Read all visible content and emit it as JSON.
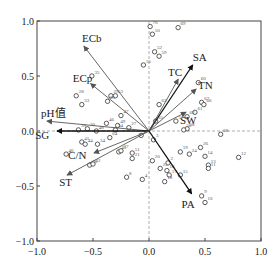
{
  "chart_data": {
    "type": "scatter",
    "subtype": "RDA biplot",
    "title": "",
    "xlabel": "",
    "ylabel": "",
    "xlim": [
      -1.0,
      1.0
    ],
    "ylim": [
      -1.0,
      1.0
    ],
    "xticks": [
      "-1.0",
      "-0.5",
      "0.0",
      "0.5",
      "1.0"
    ],
    "yticks": [
      "1.0",
      "0.5",
      "0.0",
      "-0.5",
      "-1.0"
    ],
    "grid": false,
    "zero_lines": true,
    "vectors": [
      {
        "name": "ECb",
        "x": -0.58,
        "y": 0.77,
        "color": "#555555",
        "label_dx": -2,
        "label_dy": -4
      },
      {
        "name": "ECp",
        "x": -0.52,
        "y": 0.43,
        "color": "#555555",
        "label_dx": -18,
        "label_dy": -2
      },
      {
        "name": "pH值",
        "x": -0.91,
        "y": 0.09,
        "color": "#555555",
        "label_dx": -6,
        "label_dy": -4
      },
      {
        "name": "SG",
        "x": -0.82,
        "y": 0.0,
        "color": "#111111",
        "label_dx": -22,
        "label_dy": 8
      },
      {
        "name": "C/N",
        "x": -0.49,
        "y": -0.2,
        "color": "#555555",
        "label_dx": -26,
        "label_dy": 6
      },
      {
        "name": "ST",
        "x": -0.73,
        "y": -0.4,
        "color": "#555555",
        "label_dx": -8,
        "label_dy": 11
      },
      {
        "name": "SA",
        "x": 0.39,
        "y": 0.6,
        "color": "#111111",
        "label_dx": 0,
        "label_dy": -4
      },
      {
        "name": "TC",
        "x": 0.26,
        "y": 0.47,
        "color": "#555555",
        "label_dx": -10,
        "label_dy": -3
      },
      {
        "name": "TN",
        "x": 0.42,
        "y": 0.38,
        "color": "#555555",
        "label_dx": 2,
        "label_dy": 0
      },
      {
        "name": "SW",
        "x": 0.33,
        "y": 0.17,
        "color": "#555555",
        "label_dx": -6,
        "label_dy": 12
      },
      {
        "name": "PA",
        "x": 0.38,
        "y": -0.57,
        "color": "#111111",
        "label_dx": -10,
        "label_dy": 14
      }
    ],
    "points": [
      {
        "id": "70",
        "x": 0.01,
        "y": 0.95
      },
      {
        "id": "69",
        "x": 0.26,
        "y": 0.94
      },
      {
        "id": "50",
        "x": 0.03,
        "y": 0.88
      },
      {
        "id": "52",
        "x": 0.05,
        "y": 0.72
      },
      {
        "id": "59",
        "x": 0.09,
        "y": 0.68
      },
      {
        "id": "55",
        "x": -0.05,
        "y": 0.6
      },
      {
        "id": "60",
        "x": 0.44,
        "y": 0.44
      },
      {
        "id": "63",
        "x": 0.09,
        "y": 0.24
      },
      {
        "id": "67",
        "x": 0.47,
        "y": 0.26
      },
      {
        "id": "66",
        "x": 0.49,
        "y": 0.24
      },
      {
        "id": "61",
        "x": 0.41,
        "y": 0.17
      },
      {
        "id": "62",
        "x": 0.34,
        "y": 0.13
      },
      {
        "id": "57",
        "x": 0.24,
        "y": 0.09
      },
      {
        "id": "65",
        "x": 0.06,
        "y": 0.09
      },
      {
        "id": "58",
        "x": 0.34,
        "y": 0.02
      },
      {
        "id": "56",
        "x": 0.31,
        "y": 0.01
      },
      {
        "id": "68",
        "x": 0.64,
        "y": -0.03
      },
      {
        "id": "12",
        "x": 0.8,
        "y": -0.24
      },
      {
        "id": "35",
        "x": -0.51,
        "y": 0.5
      },
      {
        "id": "28",
        "x": -0.65,
        "y": 0.32
      },
      {
        "id": "33",
        "x": -0.6,
        "y": 0.24
      },
      {
        "id": "29",
        "x": -0.34,
        "y": 0.32
      },
      {
        "id": "53",
        "x": -0.3,
        "y": 0.32
      },
      {
        "id": "25",
        "x": -0.37,
        "y": 0.27
      },
      {
        "id": "47",
        "x": -0.25,
        "y": 0.14
      },
      {
        "id": "46",
        "x": -0.38,
        "y": 0.07
      },
      {
        "id": "49",
        "x": -0.28,
        "y": 0.05
      },
      {
        "id": "27",
        "x": -0.18,
        "y": 0.03
      },
      {
        "id": "39",
        "x": -0.63,
        "y": 0.01
      },
      {
        "id": "30",
        "x": -0.55,
        "y": 0.02
      },
      {
        "id": "48",
        "x": -0.47,
        "y": 0.0
      },
      {
        "id": "54",
        "x": -0.3,
        "y": 0.01
      },
      {
        "id": "41",
        "x": -0.6,
        "y": -0.1
      },
      {
        "id": "44",
        "x": -0.57,
        "y": -0.12
      },
      {
        "id": "34",
        "x": -0.46,
        "y": -0.12
      },
      {
        "id": "64",
        "x": -0.35,
        "y": -0.06
      },
      {
        "id": "40",
        "x": -0.74,
        "y": -0.21
      },
      {
        "id": "45",
        "x": -0.27,
        "y": -0.19
      },
      {
        "id": "37",
        "x": -0.25,
        "y": -0.18
      },
      {
        "id": "38",
        "x": -0.53,
        "y": -0.31
      },
      {
        "id": "32",
        "x": -0.5,
        "y": -0.3
      },
      {
        "id": "1",
        "x": -0.07,
        "y": -0.04
      },
      {
        "id": "3",
        "x": 0.04,
        "y": -0.08
      },
      {
        "id": "51",
        "x": -0.15,
        "y": -0.2
      },
      {
        "id": "21",
        "x": -0.15,
        "y": -0.25
      },
      {
        "id": "8",
        "x": -0.2,
        "y": -0.42
      },
      {
        "id": "4",
        "x": -0.06,
        "y": -0.44
      },
      {
        "id": "19",
        "x": 0.28,
        "y": -0.19
      },
      {
        "id": "24",
        "x": 0.36,
        "y": -0.21
      },
      {
        "id": "26",
        "x": 0.46,
        "y": -0.15
      },
      {
        "id": "14",
        "x": 0.5,
        "y": -0.23
      },
      {
        "id": "13",
        "x": 0.53,
        "y": -0.31
      },
      {
        "id": "11",
        "x": 0.53,
        "y": -0.34
      },
      {
        "id": "20",
        "x": 0.03,
        "y": -0.27
      },
      {
        "id": "22",
        "x": 0.1,
        "y": -0.34
      },
      {
        "id": "2",
        "x": 0.17,
        "y": -0.29
      },
      {
        "id": "16",
        "x": 0.16,
        "y": -0.36
      },
      {
        "id": "17",
        "x": 0.18,
        "y": -0.4
      },
      {
        "id": "15",
        "x": 0.28,
        "y": -0.4
      },
      {
        "id": "18",
        "x": 0.14,
        "y": -0.46
      },
      {
        "id": "9",
        "x": 0.47,
        "y": -0.59
      },
      {
        "id": "10",
        "x": 0.5,
        "y": -0.65
      }
    ]
  }
}
